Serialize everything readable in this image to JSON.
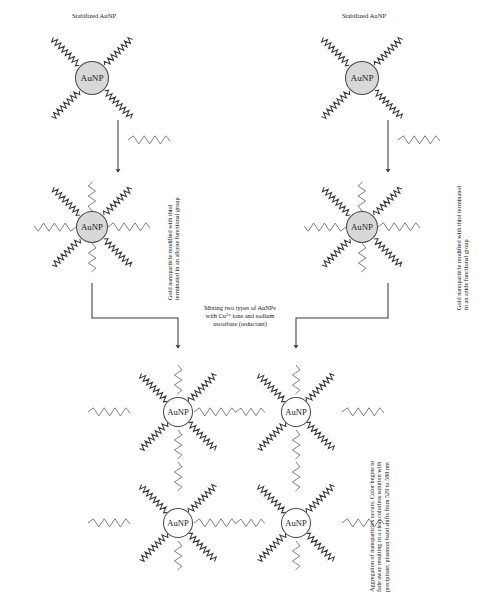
{
  "diagram": {
    "type": "reaction-scheme",
    "node_label": "AuNP",
    "colors": {
      "particle_fill": "#d8d8d8",
      "stroke": "#3a3a3a",
      "text": "#222222",
      "background": "#ffffff"
    },
    "stages": [
      {
        "id": "stage-1-left",
        "caption": "Stabilized AuNP",
        "arms_dense": 4,
        "arms_sparse": 0,
        "x": 92,
        "y": 78
      },
      {
        "id": "stage-1-right",
        "caption": "Stabilized AuNP",
        "arms_dense": 4,
        "arms_sparse": 0,
        "x": 362,
        "y": 78
      },
      {
        "id": "stage-2-left",
        "caption": "Gold nanoparticle modified with thiol\nterminated in an alkyne functional group",
        "arms_dense": 4,
        "arms_sparse": 4,
        "x": 92,
        "y": 227
      },
      {
        "id": "stage-2-right",
        "caption": "Gold nanoparticle modified with thiol terminated\nin an azide functional group",
        "arms_dense": 4,
        "arms_sparse": 4,
        "x": 362,
        "y": 227
      }
    ],
    "reagent_left": "thiol-alkyne-ligand",
    "reagent_right": "thiol-azide-ligand",
    "mixing_caption": "Mixing two types of AuNPs\nwith Cu²⁺ ions and sodium\nascorbate (reductant)",
    "result_caption": "Aggregation of nanoparticles occurs. Color begins to\nfade away resulting in a clear colorless solution with\nprecipitate; plasmon band shifts from 529 to 588 nm",
    "aggregate": {
      "id": "stage-3-aggregate",
      "rows": 2,
      "columns": 2,
      "node_count": 4,
      "nodes": [
        {
          "x": 178,
          "y": 412
        },
        {
          "x": 296,
          "y": 412
        },
        {
          "x": 178,
          "y": 523
        },
        {
          "x": 296,
          "y": 523
        }
      ]
    },
    "plasmon_shift": {
      "from_nm": 529,
      "to_nm": 588,
      "unit": "nm"
    }
  }
}
